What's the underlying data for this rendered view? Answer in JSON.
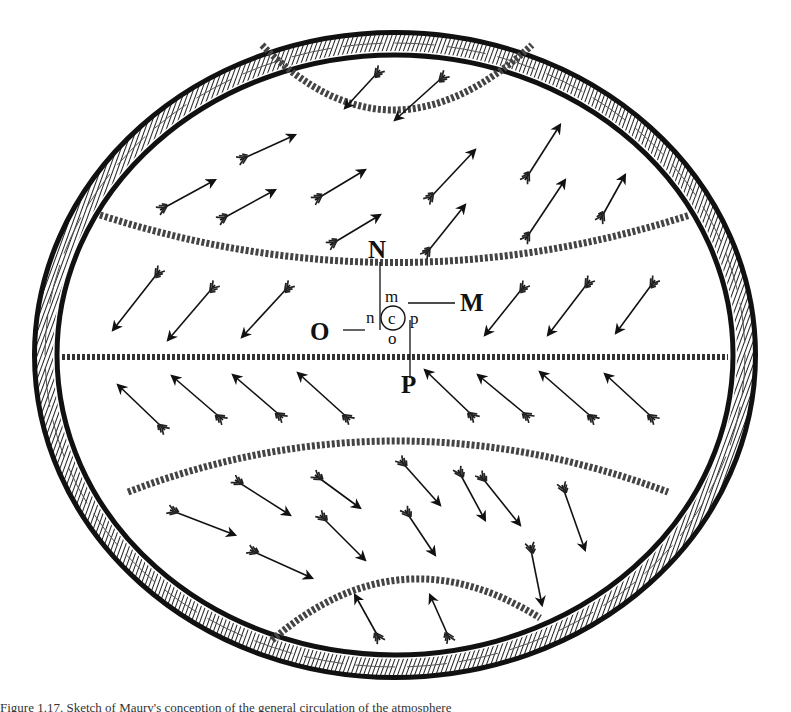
{
  "figure": {
    "labels": {
      "N": "N",
      "M": "M",
      "O": "O",
      "P": "P",
      "m": "m",
      "n": "n",
      "c": "c",
      "p": "p",
      "o": "o"
    },
    "colors": {
      "ink": "#111111",
      "paper": "#ffffff"
    },
    "zones": [
      {
        "name": "north-polar-cap",
        "wind_direction": "down-left"
      },
      {
        "name": "north-temperate",
        "wind_direction": "up-right"
      },
      {
        "name": "north-trade",
        "wind_direction": "down-left"
      },
      {
        "name": "south-trade",
        "wind_direction": "up-left"
      },
      {
        "name": "south-temperate",
        "wind_direction": "down-right"
      },
      {
        "name": "south-polar-cap",
        "wind_direction": "up-left"
      }
    ]
  },
  "caption": {
    "text": "Figure 1.17. Sketch of Maury's conception of the general circulation of the atmosphere"
  }
}
